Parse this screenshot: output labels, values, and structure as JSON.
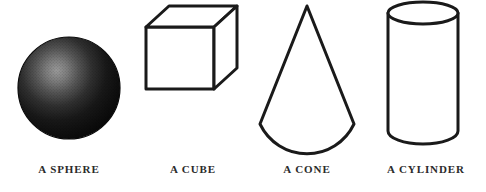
{
  "figure": {
    "background_color": "#ffffff",
    "label_color": "#2b2b2b",
    "stroke_color": "#1a1a1a",
    "width": 486,
    "height": 192
  },
  "shapes": [
    {
      "id": "sphere",
      "label": "A SPHERE",
      "icon_name": "sphere-shape",
      "render": "shaded-solid",
      "fill": "#111111",
      "highlight_color": "#8d8d8d",
      "highlight_position": "upper-left",
      "bounds": {
        "cx": 69,
        "cy": 88,
        "rx": 51,
        "ry": 51
      }
    },
    {
      "id": "cube",
      "label": "A CUBE",
      "icon_name": "cube-shape",
      "render": "wireframe-outline",
      "fill": "#ffffff",
      "stroke_width": 3,
      "bounds": {
        "x": 145,
        "y": 40,
        "width": 100,
        "height": 85
      }
    },
    {
      "id": "cone",
      "label": "A CONE",
      "icon_name": "cone-shape",
      "render": "outline",
      "fill": "#ffffff",
      "stroke_width": 3,
      "bounds": {
        "apex_x": 307,
        "apex_y": 12,
        "base_left": 262,
        "base_right": 354,
        "base_y": 130,
        "base_dip_y": 144
      }
    },
    {
      "id": "cylinder",
      "label": "A CYLINDER",
      "icon_name": "cylinder-shape",
      "render": "outline",
      "fill": "#ffffff",
      "stroke_width": 3,
      "bounds": {
        "x": 388,
        "y": 8,
        "width": 70,
        "height": 140,
        "ellipse_ry": 11
      }
    }
  ]
}
